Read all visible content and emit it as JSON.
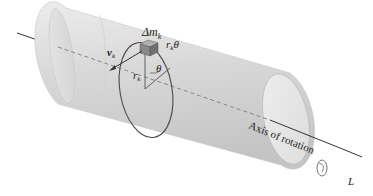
{
  "diagram": {
    "labels": {
      "mass": "Δm",
      "mass_sub": "k",
      "arc": "r",
      "arc_sub": "k",
      "arc_angle": "θ",
      "velocity": "v",
      "velocity_sub": "k",
      "radius": "r",
      "radius_sub": "k",
      "angle": "θ",
      "axis_caption": "Axis of rotation",
      "axis_name": "L"
    },
    "colors": {
      "cylinder_fill": "#d9d9d9",
      "cylinder_edge": "#bdbdbd",
      "axis_line": "#333333",
      "ring": "#4a4a4a",
      "mass_block": "#8a8a8a"
    }
  }
}
